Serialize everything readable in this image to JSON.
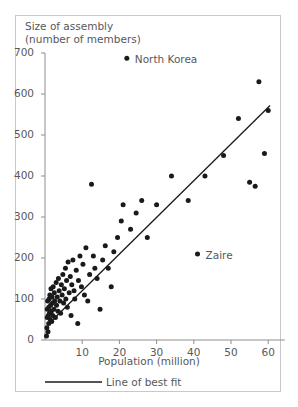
{
  "figure": {
    "clipped_header_text": "",
    "y_axis_title_line1": "Size of assembly",
    "y_axis_title_line2": "(number of members)",
    "x_axis_title": "Population (million)",
    "legend_label": "Line of best fit"
  },
  "chart_data": {
    "type": "scatter",
    "title": "",
    "xlabel": "Population (million)",
    "ylabel": "Size of assembly (number of members)",
    "xlim": [
      0,
      65
    ],
    "ylim": [
      0,
      700
    ],
    "xticks": [
      10,
      20,
      30,
      40,
      50,
      60
    ],
    "yticks": [
      0,
      100,
      200,
      300,
      400,
      500,
      600,
      700
    ],
    "grid": false,
    "legend": [
      {
        "label": "Line of best fit",
        "marker": "line",
        "color": "#1a1a1a"
      }
    ],
    "annotations": [
      {
        "label": "North Korea",
        "x": 22.0,
        "y": 687
      },
      {
        "label": "Zaire",
        "x": 41.0,
        "y": 210
      }
    ],
    "line_of_best_fit": {
      "x": [
        0.8,
        60.5
      ],
      "y": [
        38,
        572
      ],
      "color": "#1a1a1a"
    },
    "points": [
      [
        0.4,
        10
      ],
      [
        0.5,
        30
      ],
      [
        0.6,
        55
      ],
      [
        0.6,
        75
      ],
      [
        0.7,
        95
      ],
      [
        0.8,
        20
      ],
      [
        0.9,
        60
      ],
      [
        1.0,
        40
      ],
      [
        1.0,
        80
      ],
      [
        1.1,
        100
      ],
      [
        1.2,
        65
      ],
      [
        1.3,
        110
      ],
      [
        1.4,
        50
      ],
      [
        1.5,
        85
      ],
      [
        1.6,
        125
      ],
      [
        1.7,
        70
      ],
      [
        1.8,
        45
      ],
      [
        1.9,
        105
      ],
      [
        2.0,
        90
      ],
      [
        2.1,
        60
      ],
      [
        2.2,
        130
      ],
      [
        2.4,
        75
      ],
      [
        2.5,
        115
      ],
      [
        2.6,
        95
      ],
      [
        2.8,
        55
      ],
      [
        3.0,
        140
      ],
      [
        3.1,
        85
      ],
      [
        3.3,
        105
      ],
      [
        3.5,
        70
      ],
      [
        3.6,
        150
      ],
      [
        3.8,
        120
      ],
      [
        4.0,
        95
      ],
      [
        4.2,
        65
      ],
      [
        4.4,
        135
      ],
      [
        4.6,
        110
      ],
      [
        4.8,
        160
      ],
      [
        5.0,
        90
      ],
      [
        5.2,
        125
      ],
      [
        5.5,
        175
      ],
      [
        5.6,
        100
      ],
      [
        5.8,
        145
      ],
      [
        6.0,
        80
      ],
      [
        6.2,
        190
      ],
      [
        6.5,
        115
      ],
      [
        6.8,
        155
      ],
      [
        7.0,
        60
      ],
      [
        7.2,
        135
      ],
      [
        7.5,
        195
      ],
      [
        7.8,
        120
      ],
      [
        8.0,
        100
      ],
      [
        8.4,
        170
      ],
      [
        8.8,
        40
      ],
      [
        9.0,
        145
      ],
      [
        9.4,
        205
      ],
      [
        9.8,
        130
      ],
      [
        10.2,
        185
      ],
      [
        10.6,
        110
      ],
      [
        11.0,
        225
      ],
      [
        11.5,
        95
      ],
      [
        12.0,
        160
      ],
      [
        12.5,
        380
      ],
      [
        13.0,
        205
      ],
      [
        13.4,
        175
      ],
      [
        14.0,
        150
      ],
      [
        14.8,
        75
      ],
      [
        15.5,
        195
      ],
      [
        16.2,
        230
      ],
      [
        17.0,
        175
      ],
      [
        17.8,
        130
      ],
      [
        18.5,
        215
      ],
      [
        19.5,
        250
      ],
      [
        20.5,
        290
      ],
      [
        21.0,
        330
      ],
      [
        22.0,
        687
      ],
      [
        23.0,
        270
      ],
      [
        24.5,
        310
      ],
      [
        26.0,
        340
      ],
      [
        27.5,
        250
      ],
      [
        30.0,
        330
      ],
      [
        34.0,
        400
      ],
      [
        38.5,
        340
      ],
      [
        41.0,
        210
      ],
      [
        43.0,
        400
      ],
      [
        48.0,
        450
      ],
      [
        52.0,
        540
      ],
      [
        55.0,
        385
      ],
      [
        56.5,
        375
      ],
      [
        57.5,
        630
      ],
      [
        59.0,
        455
      ],
      [
        60.0,
        560
      ]
    ]
  }
}
